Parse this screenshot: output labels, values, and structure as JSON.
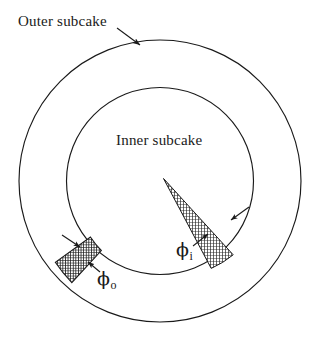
{
  "figure": {
    "type": "annulus-subcake-diagram",
    "title_labels": {
      "outer": "Outer subcake",
      "inner": "Inner subcake"
    },
    "angle_labels": {
      "inner_symbol": "ϕ",
      "inner_subscript": "i",
      "outer_symbol": "ϕ",
      "outer_subscript": "o"
    },
    "geometry": {
      "center_x": 160,
      "center_y": 181,
      "outer_radius": 141,
      "inner_radius": 94,
      "inner_wedge": {
        "start_angle_deg": 38,
        "end_angle_deg": 57,
        "fill": "hatched"
      },
      "outer_wedge": {
        "start_angle_deg": 198,
        "end_angle_deg": 218,
        "fill": "hatched-dark"
      }
    },
    "colors": {
      "stroke": "#1a1a1a",
      "hatch": "#2b2b2b",
      "background": "#ffffff"
    },
    "leader_lines": {
      "outer_subcake": "arrow pointing down-right to outer circle",
      "phi_i": "arrow pointing up-right to inner wedge",
      "phi_o": "arrow pointing up-left to outer wedge"
    }
  }
}
